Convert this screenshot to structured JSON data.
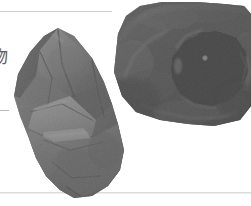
{
  "page": {
    "width": 251,
    "height": 206,
    "background": "#ffffff",
    "kind": "scanned-book-figure",
    "colorspace": "grayscale"
  },
  "edge_text": {
    "glyph": "物",
    "note_clipped": "left-clipped character at page margin",
    "color": "#5d5d5d"
  },
  "rules": [
    {
      "name": "top-rule",
      "x": 0,
      "y": 11,
      "width": 112,
      "color": "#cfcfcf"
    },
    {
      "name": "mid-tick",
      "x": 0,
      "y": 110,
      "width": 9,
      "color": "#b8b8b8"
    },
    {
      "name": "bottom-rule",
      "x": 0,
      "y": 192,
      "width": 251,
      "color": "#dcdcdc"
    }
  ],
  "figure": {
    "caption": "",
    "specimens": [
      {
        "id": "left-specimen",
        "label": "faceted angular mineral fragment",
        "position": {
          "x": 14,
          "y": 28,
          "width": 112,
          "height": 170
        },
        "tone": "mid-grey",
        "colors": {
          "highlight": "#cfcfcf",
          "midtone": "#8d8d8d",
          "shadow": "#3a3a3a",
          "deep": "#1d1d1d"
        }
      },
      {
        "id": "right-specimen",
        "label": "dark vesicular rock with large cavity",
        "position": {
          "x": 110,
          "y": 2,
          "width": 141,
          "height": 126
        },
        "tone": "dark",
        "colors": {
          "highlight": "#9a9a9a",
          "midtone": "#4a4a4a",
          "shadow": "#212121",
          "cavity": "#070707",
          "speck": "#b9b9b9"
        }
      }
    ]
  }
}
